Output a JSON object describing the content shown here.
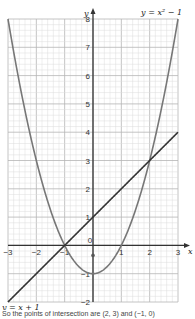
{
  "chart_data": {
    "type": "line",
    "title": "",
    "xlabel": "x",
    "ylabel": "y",
    "xlim": [
      -3,
      3
    ],
    "ylim": [
      -2,
      8
    ],
    "grid": true,
    "minor_grid_step": 0.2,
    "x_ticks": [
      -3,
      -2,
      -1,
      0,
      1,
      2,
      3
    ],
    "y_ticks": [
      -2,
      -1,
      1,
      2,
      3,
      4,
      5,
      6,
      7,
      8
    ],
    "series": [
      {
        "name": "y = x² − 1",
        "formula": "x*x-1",
        "label_position": "top-right",
        "color": "#777777"
      },
      {
        "name": "y = x + 1",
        "formula": "x+1",
        "label_position": "bottom-left",
        "color": "#333333"
      }
    ],
    "intersections": [
      [
        -1,
        0
      ],
      [
        2,
        3
      ]
    ]
  },
  "footer_text": "So the points of intersection are (2, 3) and (−1, 0)"
}
